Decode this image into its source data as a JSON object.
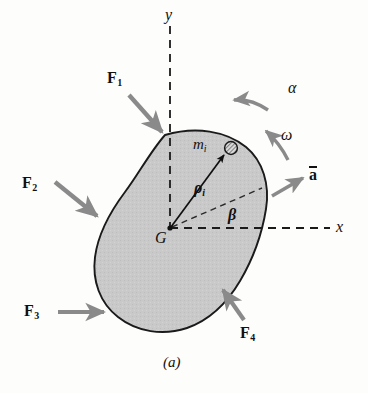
{
  "figure": {
    "caption": "(a)",
    "kind": "rigid-body-free-body-diagram"
  },
  "axes": {
    "x_label": "x",
    "y_label": "y",
    "style": "dashed",
    "origin_label": "G"
  },
  "body": {
    "fill_color": "#c9c9c9",
    "outline_color": "#1a1a1a",
    "label": "rigid-body-outline"
  },
  "center_of_mass": {
    "label": "G",
    "x": 170,
    "y": 228
  },
  "particle": {
    "mass_label": "m",
    "mass_subscript": "i",
    "fill": "hatched"
  },
  "vectors": {
    "rho": {
      "symbol": "ρ",
      "subscript": "i",
      "description": "position vector from G to particle m_i"
    },
    "acceleration": {
      "symbol": "a",
      "overbar": true,
      "description": "acceleration of mass center"
    },
    "alpha": {
      "symbol": "α",
      "description": "angular acceleration"
    },
    "omega": {
      "symbol": "ω",
      "description": "angular velocity"
    },
    "beta": {
      "symbol": "β",
      "description": "angle from x-axis to rho_i"
    }
  },
  "forces": [
    {
      "symbol": "F",
      "subscript": "1",
      "label": "F1",
      "direction": "down-right"
    },
    {
      "symbol": "F",
      "subscript": "2",
      "label": "F2",
      "direction": "down-right"
    },
    {
      "symbol": "F",
      "subscript": "3",
      "label": "F3",
      "direction": "right"
    },
    {
      "symbol": "F",
      "subscript": "4",
      "label": "F4",
      "direction": "up-left"
    }
  ],
  "colors": {
    "arrow_gray": "#8a8a8a",
    "ink": "#101010",
    "body_fill": "#c9c9c9",
    "background": "#fdfdfc"
  }
}
